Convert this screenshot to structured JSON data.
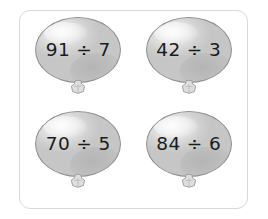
{
  "worksheet": {
    "title": "Division balloons practice grid",
    "frame_color": "#d8d8d8",
    "background_color": "#ffffff",
    "balloon_fill_color": "#dcdcdc",
    "balloon_outline_color": "#8e8e8e",
    "text_color": "#1b1b1b",
    "columns": 2,
    "rows": 2
  },
  "balloons": [
    {
      "id": "balloon-1",
      "expression": "91 ÷ 7",
      "dividend": 91,
      "divisor": 7,
      "operator": "÷",
      "position": "top-left"
    },
    {
      "id": "balloon-2",
      "expression": "42 ÷ 3",
      "dividend": 42,
      "divisor": 3,
      "operator": "÷",
      "position": "top-right"
    },
    {
      "id": "balloon-3",
      "expression": "70 ÷ 5",
      "dividend": 70,
      "divisor": 5,
      "operator": "÷",
      "position": "bottom-left"
    },
    {
      "id": "balloon-4",
      "expression": "84 ÷ 6",
      "dividend": 84,
      "divisor": 6,
      "operator": "÷",
      "position": "bottom-right"
    }
  ]
}
